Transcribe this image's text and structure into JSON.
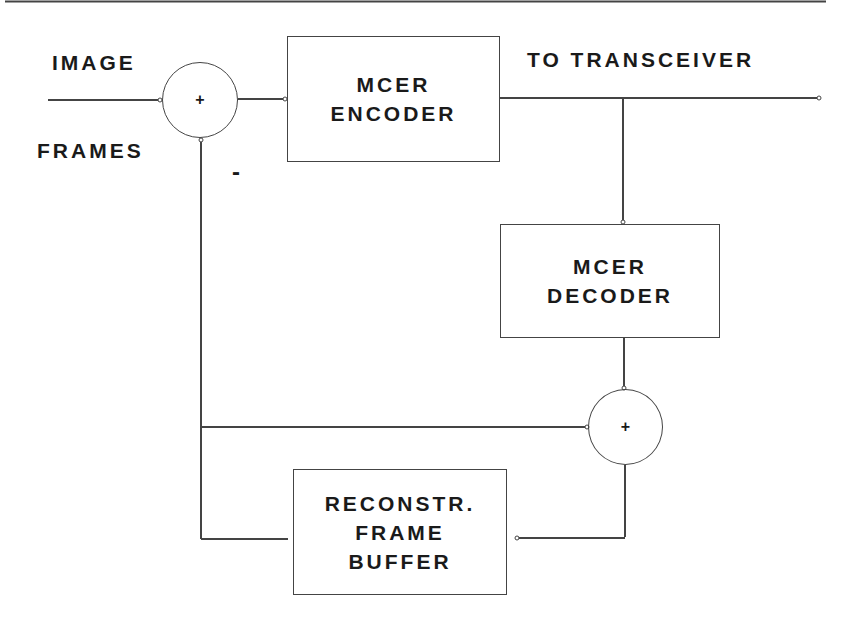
{
  "diagram": {
    "type": "block-diagram",
    "labels": {
      "input_top": "IMAGE",
      "input_bottom": "FRAMES",
      "output": "TO TRANSCEIVER",
      "minus_sign": "-"
    },
    "blocks": {
      "encoder": {
        "line1": "MCER",
        "line2": "ENCODER"
      },
      "decoder": {
        "line1": "MCER",
        "line2": "DECODER"
      },
      "buffer": {
        "line1": "RECONSTR.",
        "line2": "FRAME",
        "line3": "BUFFER"
      }
    },
    "summers": {
      "input_summer": {
        "sign": "+"
      },
      "reconstruction_summer": {
        "sign": "+"
      }
    },
    "colors": {
      "line": "#444444",
      "text": "#1a1a1a",
      "background": "#ffffff"
    }
  }
}
